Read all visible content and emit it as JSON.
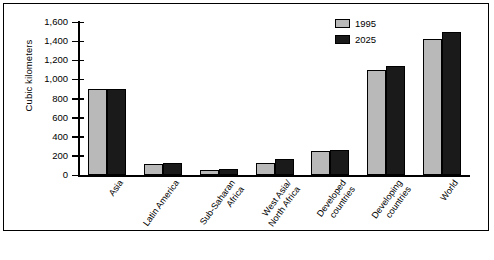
{
  "chart_data": {
    "type": "bar",
    "title": "",
    "xlabel": "",
    "ylabel": "Cubic kilometers",
    "ylim": [
      0,
      1600
    ],
    "ytick_step": 200,
    "grid": false,
    "legend_position": "top-right",
    "categories": [
      "Asia",
      "Latin America",
      "Sub-Saharan\nAfrica",
      "West Asia/\nNorth Africa",
      "Developed\ncountries",
      "Developing\ncountries",
      "World"
    ],
    "ytick_labels": [
      "0",
      "200",
      "400",
      "600",
      "800",
      "1,000",
      "1,200",
      "1,400",
      "1,600"
    ],
    "ytick_values": [
      0,
      200,
      400,
      600,
      800,
      1000,
      1200,
      1400,
      1600
    ],
    "series": [
      {
        "name": "1995",
        "color": "#b9b9b9",
        "values": [
          900,
          120,
          50,
          130,
          250,
          1100,
          1420
        ]
      },
      {
        "name": "2025",
        "color": "#1a1a1a",
        "values": [
          900,
          130,
          60,
          170,
          265,
          1140,
          1500
        ]
      }
    ]
  },
  "legend": {
    "items": [
      {
        "label": "1995",
        "swatch": "light-gray"
      },
      {
        "label": "2025",
        "swatch": "black"
      }
    ]
  },
  "axis": {
    "y_title": "Cubic kilometers"
  }
}
